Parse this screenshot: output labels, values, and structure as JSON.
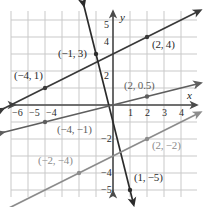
{
  "figure": {
    "kind": "coordinate-plane-graph",
    "background_color": "#ffffff",
    "grid_color": "#c9c9c9",
    "axis_color": "#4a4a4a"
  },
  "chart_data": {
    "type": "line",
    "title": "",
    "subtitle": "",
    "xlabel": "x",
    "ylabel": "y",
    "xlim": [
      -6.8,
      5.2
    ],
    "ylim": [
      -5.8,
      6.0
    ],
    "grid": true,
    "legend_position": "none",
    "x_ticks": [
      -6,
      -5,
      -4,
      1,
      2,
      3,
      4
    ],
    "x_tick_labels": [
      "−6",
      "−5",
      "−4",
      "1",
      "2",
      "3",
      "4"
    ],
    "y_ticks": [
      5,
      4,
      2,
      -2,
      -4,
      -5
    ],
    "y_tick_labels": [
      "5",
      "4",
      "2",
      "−2",
      "−4",
      "−5"
    ],
    "series": [
      {
        "name": "line-a",
        "color": "#3a3a3a",
        "slope": 0.5,
        "intercept": 3,
        "x_range": [
          -6.6,
          5.0
        ],
        "points": [
          {
            "x": -4,
            "y": 1,
            "label": "(−4, 1)"
          },
          {
            "x": 2,
            "y": 4,
            "label": "(2, 4)"
          }
        ]
      },
      {
        "name": "line-b",
        "color": "#2b2b2b",
        "slope": -4,
        "intercept": -1,
        "x_range": [
          -1.75,
          1.18
        ],
        "points": [
          {
            "x": -1,
            "y": 3,
            "label": "(−1, 3)"
          },
          {
            "x": 1,
            "y": -5,
            "label": "(1, −5)"
          }
        ]
      },
      {
        "name": "line-c",
        "color": "#5e5e5e",
        "slope": 0.25,
        "intercept": 0,
        "x_range": [
          -6.6,
          5.0
        ],
        "points": [
          {
            "x": -4,
            "y": -1,
            "label": "(−4, −1)"
          },
          {
            "x": 2,
            "y": 0.5,
            "label": "(2, 0.5)"
          }
        ]
      },
      {
        "name": "line-d",
        "color": "#8c8c8c",
        "slope": 0.5,
        "intercept": -3,
        "x_range": [
          -6.6,
          5.0
        ],
        "points": [
          {
            "x": -2,
            "y": -4,
            "label": "(−2, −4)"
          },
          {
            "x": 2,
            "y": -2,
            "label": "(2, −2)"
          }
        ]
      }
    ],
    "annotations": [
      {
        "text": "(−1, 3)",
        "name": "point-label-neg1-3",
        "color": "#2b2b2b",
        "left": 58,
        "top": 48
      },
      {
        "text": "(2, 4)",
        "name": "point-label-2-4",
        "color": "#2b2b2b",
        "left": 152,
        "top": 39
      },
      {
        "text": "(−4, 1)",
        "name": "point-label-neg4-1",
        "color": "#2b2b2b",
        "left": 14,
        "top": 70
      },
      {
        "text": "(2, 0.5)",
        "name": "point-label-2-05",
        "color": "#5e5e5e",
        "left": 124,
        "top": 80
      },
      {
        "text": "(−4, −1)",
        "name": "point-label-neg4-neg1",
        "color": "#5e5e5e",
        "left": 57,
        "top": 124
      },
      {
        "text": "(−2, −4)",
        "name": "point-label-neg2-neg4",
        "color": "#8c8c8c",
        "left": 38,
        "top": 155
      },
      {
        "text": "(2, −2)",
        "name": "point-label-2-neg2",
        "color": "#8c8c8c",
        "left": 152,
        "top": 140
      },
      {
        "text": "(1, −5)",
        "name": "point-label-1-neg5",
        "color": "#2b2b2b",
        "left": 134,
        "top": 172
      }
    ],
    "axis_letters": [
      {
        "text": "y",
        "name": "y-axis-letter",
        "left": 120,
        "top": 12
      },
      {
        "text": "x",
        "name": "x-axis-letter",
        "left": 187,
        "top": 90
      }
    ],
    "tick_text": [
      {
        "text": "−6",
        "name": "x-tick-neg6",
        "left": 12,
        "top": 108
      },
      {
        "text": "−5",
        "name": "x-tick-neg5",
        "left": 29,
        "top": 108
      },
      {
        "text": "−4",
        "name": "x-tick-neg4",
        "left": 46,
        "top": 108
      },
      {
        "text": "1",
        "name": "x-tick-1",
        "left": 128,
        "top": 108
      },
      {
        "text": "2",
        "name": "x-tick-2",
        "left": 145,
        "top": 108
      },
      {
        "text": "3",
        "name": "x-tick-3",
        "left": 162,
        "top": 108
      },
      {
        "text": "4",
        "name": "x-tick-4",
        "left": 179,
        "top": 108
      },
      {
        "text": "5",
        "name": "y-tick-5",
        "left": 104,
        "top": 20
      },
      {
        "text": "4",
        "name": "y-tick-4",
        "left": 104,
        "top": 37
      },
      {
        "text": "2",
        "name": "y-tick-2",
        "left": 104,
        "top": 71
      },
      {
        "text": "−2",
        "name": "y-tick-neg2",
        "left": 101,
        "top": 134
      },
      {
        "text": "−4",
        "name": "y-tick-neg4",
        "left": 101,
        "top": 168
      },
      {
        "text": "−5",
        "name": "y-tick-neg5",
        "left": 101,
        "top": 185
      }
    ]
  }
}
